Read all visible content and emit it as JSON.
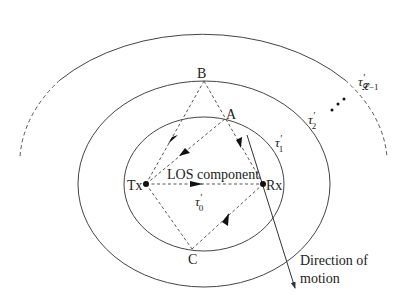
{
  "diagram": {
    "type": "multipath-propagation-ellipses",
    "nodes": {
      "tx": {
        "label": "Tx"
      },
      "rx": {
        "label": "Rx"
      },
      "a": {
        "label": "A"
      },
      "b": {
        "label": "B"
      },
      "c": {
        "label": "C"
      }
    },
    "los_label": "LOS component",
    "delay_labels": {
      "tau0": {
        "base": "τ",
        "prime": "′",
        "sub": "0"
      },
      "tau1": {
        "base": "τ",
        "prime": "′",
        "sub": "1"
      },
      "tau2": {
        "base": "τ",
        "prime": "′",
        "sub": "2"
      },
      "tauL": {
        "base": "τ",
        "prime": "′",
        "sub": "𝓛−1"
      }
    },
    "ellipsis": "• • •",
    "motion_label_line1": "Direction of",
    "motion_label_line2": "motion",
    "colors": {
      "line": "#333333",
      "dash": "#555555",
      "background": "#ffffff"
    }
  }
}
